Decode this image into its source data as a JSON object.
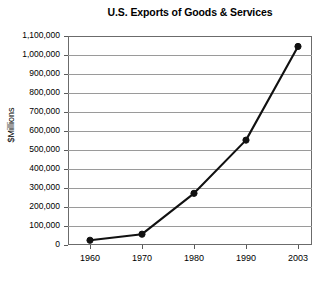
{
  "chart_data": {
    "type": "line",
    "title": "U.S. Exports of Goods & Services",
    "xlabel": "",
    "ylabel": "$Millions",
    "categories": [
      "1960",
      "1970",
      "1980",
      "1990",
      "2003"
    ],
    "values": [
      25000,
      57000,
      272000,
      552000,
      1045000
    ],
    "ylim": [
      0,
      1100000
    ],
    "yticks": [
      0,
      100000,
      200000,
      300000,
      400000,
      500000,
      600000,
      700000,
      800000,
      900000,
      1000000,
      1100000
    ],
    "ytick_labels": [
      "0",
      "100,000",
      "200,000",
      "300,000",
      "400,000",
      "500,000",
      "600,000",
      "700,000",
      "800,000",
      "900,000",
      "1,000,000",
      "1,100,000"
    ],
    "grid": true,
    "legend": "none",
    "marker": "filled-circle",
    "line_color": "#111111",
    "grid_color": "#9a9a9a",
    "frame_color": "#6b6b6b",
    "background": "#ffffff"
  }
}
